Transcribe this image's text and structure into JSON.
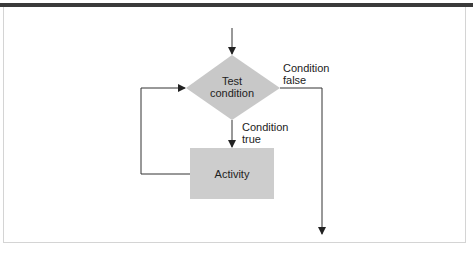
{
  "diagram": {
    "type": "flowchart-while-loop",
    "nodes": {
      "decision": {
        "label_line1": "Test",
        "label_line2": "condition",
        "fill": "#c8c8c8"
      },
      "activity": {
        "label": "Activity",
        "fill": "#cdcdcd"
      }
    },
    "edges": {
      "false_label_line1": "Condition",
      "false_label_line2": "false",
      "true_label_line1": "Condition",
      "true_label_line2": "true"
    },
    "colors": {
      "line": "#333333",
      "top_bar": "#3a3a3a",
      "frame": "#d4d4d4"
    }
  }
}
